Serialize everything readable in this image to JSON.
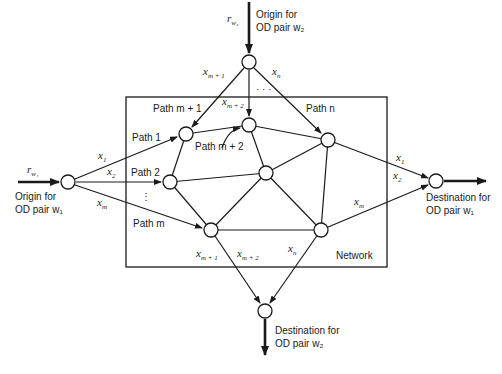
{
  "diagram": {
    "network_box_label": "Network",
    "origin_w1": {
      "flow_label": "r",
      "flow_sub": "w₁",
      "label_line1": "Origin for",
      "label_line2": "OD pair w₁"
    },
    "origin_w2": {
      "flow_label": "r",
      "flow_sub": "w₂",
      "label_line1": "Origin for",
      "label_line2": "OD pair w₂"
    },
    "destination_w1": {
      "label_line1": "Destination for",
      "label_line2": "OD pair w₁"
    },
    "destination_w2": {
      "label_line1": "Destination for",
      "label_line2": "OD pair w₂"
    },
    "paths": {
      "path1": "Path 1",
      "path2": "Path 2",
      "pathm": "Path m",
      "pathm1": "Path m + 1",
      "pathm2": "Path m + 2",
      "pathn": "Path n"
    },
    "flows": {
      "x1": "x",
      "x1_sub": "1",
      "x2": "x",
      "x2_sub": "2",
      "xm": "x",
      "xm_sub": "m",
      "xm1": "x",
      "xm1_sub": "m + 1",
      "xm2": "x",
      "xm2_sub": "m + 2",
      "xn": "x",
      "xn_sub": "n"
    },
    "ellipsis": "· · ·",
    "vertical_ellipsis": "⋮"
  }
}
